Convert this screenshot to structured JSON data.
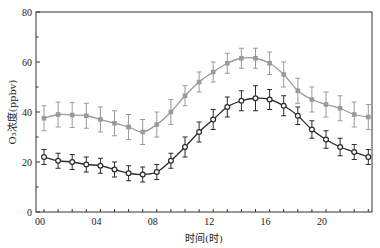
{
  "chart_data": {
    "type": "line",
    "title": "",
    "xlabel": "时间(时)",
    "ylabel": "O₃浓度(ppbv)",
    "ylim": [
      0,
      80
    ],
    "xlim": [
      0,
      23
    ],
    "x": [
      0,
      1,
      2,
      3,
      4,
      5,
      6,
      7,
      8,
      9,
      10,
      11,
      12,
      13,
      14,
      15,
      16,
      17,
      18,
      19,
      20,
      21,
      22,
      23
    ],
    "x_tick_labels": [
      "00",
      "04",
      "08",
      "12",
      "16",
      "20"
    ],
    "x_tick_values": [
      0,
      4,
      8,
      12,
      16,
      20
    ],
    "y_tick_labels": [
      "0",
      "20",
      "40",
      "60",
      "80"
    ],
    "y_tick_values": [
      0,
      20,
      40,
      60,
      80
    ],
    "grid": false,
    "legend": null,
    "series": [
      {
        "name": "gray-series",
        "color": "#9a9a9a",
        "marker": "filled-square",
        "values": [
          37.5,
          39,
          38.8,
          38.5,
          37,
          35.5,
          34,
          32,
          35,
          40,
          46.5,
          52,
          56,
          59.5,
          61.5,
          61.5,
          59.5,
          55,
          48.5,
          45,
          43,
          41.5,
          39,
          38
        ],
        "error": [
          5,
          5,
          5,
          5,
          5,
          5,
          5,
          5,
          5,
          5,
          4,
          4,
          4,
          4,
          4,
          4,
          4.5,
          5,
          5,
          5,
          5,
          5,
          5,
          5
        ]
      },
      {
        "name": "black-series",
        "color": "#2a2a2a",
        "marker": "open-circle",
        "values": [
          22,
          20.5,
          20,
          19,
          18.5,
          17,
          15.5,
          15,
          16,
          20.5,
          26,
          32,
          37,
          42,
          44.5,
          45.5,
          45,
          42.5,
          38.5,
          33,
          29,
          26,
          24,
          22
        ],
        "error": [
          3,
          3,
          3,
          3,
          3,
          3,
          3,
          3,
          3,
          3,
          4,
          4,
          4,
          4,
          4,
          5,
          4,
          4,
          3.5,
          3.5,
          3.5,
          3.5,
          3,
          3
        ]
      }
    ]
  }
}
